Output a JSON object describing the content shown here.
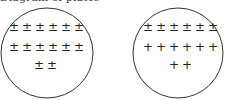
{
  "caption": "Diagram of plates",
  "plates": [
    {
      "name": "left-plate",
      "rows": [
        [
          "±",
          "±",
          "±",
          "±",
          "±",
          "±"
        ],
        [
          "±",
          "±",
          "±",
          "±",
          "±",
          "±"
        ],
        [
          "±",
          "±"
        ]
      ]
    },
    {
      "name": "right-plate",
      "rows": [
        [
          "±",
          "±",
          "±",
          "±",
          "±",
          "±"
        ],
        [
          "+",
          "+",
          "+",
          "+",
          "+",
          "+"
        ],
        [
          "+",
          "+"
        ]
      ]
    }
  ]
}
